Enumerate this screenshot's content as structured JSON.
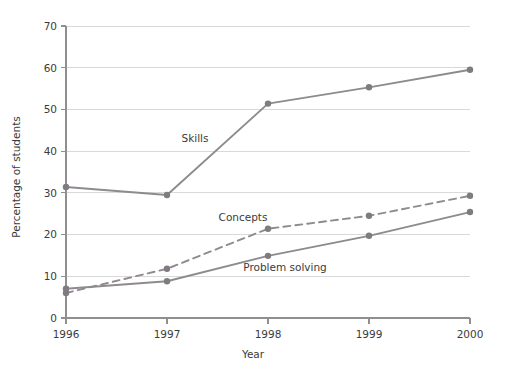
{
  "chart_data": {
    "type": "line",
    "title": "",
    "xlabel": "Year",
    "ylabel": "Percentage of students",
    "categories": [
      "1996",
      "1997",
      "1998",
      "1999",
      "2000"
    ],
    "x": [
      1996,
      1997,
      1998,
      1999,
      2000
    ],
    "xlim": [
      1996,
      2000
    ],
    "ylim": [
      0,
      70
    ],
    "yticks": [
      0,
      10,
      20,
      30,
      40,
      50,
      60,
      70
    ],
    "ytick_labels": [
      "0",
      "10",
      "20",
      "30",
      "40",
      "50",
      "60",
      "70"
    ],
    "xtick_labels": [
      "1996",
      "1997",
      "1998",
      "1999",
      "2000"
    ],
    "grid": "horizontal",
    "legend": "inline-annotations",
    "series": [
      {
        "name": "Skills",
        "style": "solid",
        "color": "#8e8a8e",
        "values": [
          31.4,
          29.5,
          51.4,
          55.3,
          59.5
        ]
      },
      {
        "name": "Concepts",
        "style": "dashed",
        "color": "#8e8a8e",
        "values": [
          6.0,
          11.8,
          21.4,
          24.5,
          29.3
        ]
      },
      {
        "name": "Problem solving",
        "style": "solid",
        "color": "#8e8a8e",
        "values": [
          7.0,
          8.8,
          14.9,
          19.7,
          25.4
        ]
      }
    ],
    "annotations": [
      {
        "text": "Skills",
        "x_px": 195,
        "y_px": 142
      },
      {
        "text": "Concepts",
        "x_px": 243,
        "y_px": 221
      },
      {
        "text": "Problem solving",
        "x_px": 285,
        "y_px": 271
      }
    ]
  },
  "colors": {
    "line": "#8e8a8e",
    "marker": "#7f7b80",
    "grid": "#d9d9d9",
    "axis": "#8f8f8f",
    "text": "#3b3b3b",
    "background": "#ffffff"
  }
}
